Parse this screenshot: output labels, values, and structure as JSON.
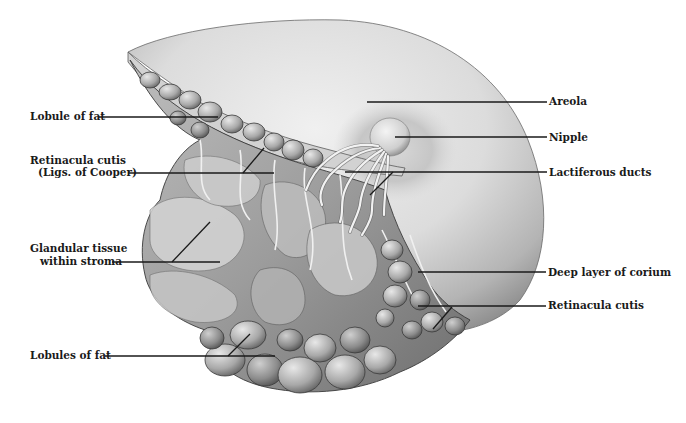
{
  "figure": {
    "colors": {
      "background": "#ffffff",
      "ink": "#1a1a1a",
      "skin_light": "#e6e6e6",
      "skin_mid": "#c4c4c4",
      "skin_dark": "#8a8a8a",
      "tissue_light": "#d6d6d6",
      "tissue_dark": "#6a6a6a",
      "duct": "#f2f2f2"
    }
  },
  "labels": {
    "left": [
      {
        "id": "lobule-of-fat",
        "lines": [
          "Lobule of fat"
        ],
        "text_x": 30,
        "text_y": 120,
        "line": {
          "x1": 99,
          "y1": 117,
          "x2": 218,
          "y2": 117
        }
      },
      {
        "id": "retinacula-cutis-cooper",
        "lines": [
          "Retinacula cutis",
          "(Ligs. of Cooper)"
        ],
        "text_x": 30,
        "text_y": 164,
        "text_x2": 38,
        "text_y2": 176,
        "line": {
          "x1": 128,
          "y1": 173,
          "x2": 274,
          "y2": 173
        }
      },
      {
        "id": "glandular-tissue",
        "lines": [
          "Glandular tissue",
          "within stroma"
        ],
        "text_x": 30,
        "text_y": 252,
        "text_x2": 40,
        "text_y2": 264,
        "line": {
          "x1": 112,
          "y1": 262,
          "x2": 220,
          "y2": 262
        }
      },
      {
        "id": "lobules-of-fat",
        "lines": [
          "Lobules of fat"
        ],
        "text_x": 30,
        "text_y": 358,
        "line": {
          "x1": 105,
          "y1": 356,
          "x2": 275,
          "y2": 356
        }
      }
    ],
    "right": [
      {
        "id": "areola",
        "lines": [
          "Areola"
        ],
        "text_x": 549,
        "text_y": 105,
        "line": {
          "x1": 367,
          "y1": 102,
          "x2": 547,
          "y2": 102
        }
      },
      {
        "id": "nipple",
        "lines": [
          "Nipple"
        ],
        "text_x": 549,
        "text_y": 141,
        "line": {
          "x1": 395,
          "y1": 137,
          "x2": 547,
          "y2": 137
        }
      },
      {
        "id": "lactiferous-ducts",
        "lines": [
          "Lactiferous ducts"
        ],
        "text_x": 549,
        "text_y": 176,
        "line": {
          "x1": 345,
          "y1": 172,
          "x2": 547,
          "y2": 172
        }
      },
      {
        "id": "deep-layer-of-corium",
        "lines": [
          "Deep layer of corium"
        ],
        "text_x": 548,
        "text_y": 276,
        "line": {
          "x1": 418,
          "y1": 272,
          "x2": 546,
          "y2": 272
        }
      },
      {
        "id": "retinacula-cutis",
        "lines": [
          "Retinacula cutis"
        ],
        "text_x": 548,
        "text_y": 309,
        "line": {
          "x1": 418,
          "y1": 306,
          "x2": 546,
          "y2": 306
        }
      }
    ],
    "pointer_ticks": [
      {
        "for": "retinacula-cutis-cooper",
        "x1": 243,
        "y1": 173,
        "x2": 264,
        "y2": 148
      },
      {
        "for": "glandular-tissue",
        "x1": 172,
        "y1": 262,
        "x2": 210,
        "y2": 222
      },
      {
        "for": "lactiferous-ducts",
        "x1": 370,
        "y1": 195,
        "x2": 393,
        "y2": 172
      },
      {
        "for": "retinacula-cutis",
        "x1": 433,
        "y1": 329,
        "x2": 452,
        "y2": 307
      },
      {
        "for": "lobules-of-fat",
        "x1": 228,
        "y1": 356,
        "x2": 250,
        "y2": 334
      }
    ]
  }
}
